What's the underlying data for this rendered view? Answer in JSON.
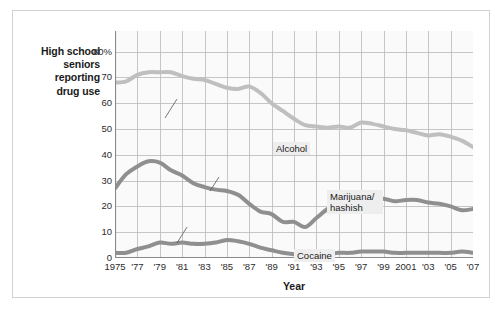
{
  "figure": {
    "y_axis_caption": "High school seniors reporting drug use",
    "y_axis_caption_lines": [
      "High school",
      "seniors",
      "reporting",
      "drug use"
    ],
    "x_axis_title": "Year"
  },
  "chart_data": {
    "type": "line",
    "title": "",
    "subtitle": "",
    "xlabel": "Year",
    "ylabel": "High school seniors reporting drug use",
    "xlim": [
      1975,
      2007
    ],
    "ylim": [
      0,
      88
    ],
    "grid": true,
    "legend_position": "inline-annotations",
    "y_ticks": [
      0,
      10,
      20,
      30,
      40,
      50,
      60,
      70,
      80
    ],
    "y_tick_labels": [
      "0",
      "10",
      "20",
      "30",
      "40",
      "50",
      "60",
      "70",
      "80%"
    ],
    "x_ticks": [
      1975,
      1977,
      1979,
      1981,
      1983,
      1985,
      1987,
      1989,
      1991,
      1993,
      1995,
      1997,
      1999,
      2001,
      2003,
      2005,
      2007
    ],
    "x_tick_labels": [
      "1975",
      "'77",
      "'79",
      "'81",
      "'83",
      "'85",
      "'87",
      "'89",
      "'91",
      "'93",
      "'95",
      "'97",
      "'99",
      "2001",
      "'03",
      "'05",
      "'07"
    ],
    "x": [
      1975,
      1976,
      1977,
      1978,
      1979,
      1980,
      1981,
      1982,
      1983,
      1984,
      1985,
      1986,
      1987,
      1988,
      1989,
      1990,
      1991,
      1992,
      1993,
      1994,
      1995,
      1996,
      1997,
      1998,
      1999,
      2000,
      2001,
      2002,
      2003,
      2004,
      2005,
      2006,
      2007
    ],
    "series": [
      {
        "name": "Alcohol",
        "color": "#bfbfbf",
        "values": [
          68,
          68.5,
          71,
          72,
          72,
          72,
          70.5,
          69.5,
          69,
          67.5,
          66,
          65.5,
          66.5,
          64,
          60,
          57,
          54,
          51.5,
          51,
          50.5,
          51,
          50.5,
          52.5,
          52,
          51,
          50,
          49.5,
          48.5,
          47.5,
          48,
          47,
          45.5,
          43
        ]
      },
      {
        "name": "Marijuana/hashish",
        "color": "#8f8f8f",
        "values": [
          27,
          32.5,
          35.5,
          37.5,
          37,
          34,
          32,
          29,
          27.5,
          26.5,
          26,
          24.5,
          21,
          18,
          17,
          14,
          14,
          12,
          15.5,
          19,
          21,
          22,
          24,
          23,
          23,
          22,
          22.5,
          22.5,
          21.5,
          21,
          20,
          18.5,
          19
        ]
      },
      {
        "name": "Cocaine",
        "color": "#8f8f8f",
        "values": [
          2,
          2,
          3.5,
          4.5,
          6,
          5.5,
          6,
          5.5,
          5.5,
          6,
          7,
          6.5,
          5.5,
          4,
          3,
          2,
          1.5,
          1.5,
          1.5,
          1.5,
          2,
          2,
          2.5,
          2.5,
          2.5,
          2,
          2,
          2,
          2,
          2,
          2,
          2.5,
          2
        ]
      }
    ],
    "annotations": [
      {
        "text": "Alcohol",
        "series": "Alcohol",
        "leader": true
      },
      {
        "text": "Marijuana/ hashish",
        "series": "Marijuana/hashish",
        "leader": true
      },
      {
        "text": "Cocaine",
        "series": "Cocaine",
        "leader": true
      }
    ]
  },
  "annotations": {
    "alcohol": "Alcohol",
    "marijuana_line1": "Marijuana/",
    "marijuana_line2": "hashish",
    "cocaine": "Cocaine"
  },
  "colors": {
    "alcohol_line": "#bfbfbf",
    "marijuana_line": "#8f8f8f",
    "cocaine_line": "#8f8f8f",
    "grid": "#b9b9b9",
    "plot_bg": "#fafafa",
    "frame_border": "#d2d2d2",
    "label_bg": "#eeeeee"
  }
}
